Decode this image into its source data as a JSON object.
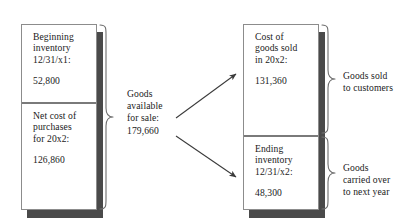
{
  "diagram": {
    "colors": {
      "shadow": "#4a4a4a",
      "box_border": "#8c8c8c",
      "divider": "#7a7a7a",
      "arrow": "#3a3a3a",
      "brace": "#6e6e6e",
      "text": "#1a1a1a",
      "background": "#ffffff"
    },
    "left_stack": {
      "beginning_inventory": {
        "line1": "Beginning",
        "line2": "inventory",
        "line3": "12/31/x1:",
        "amount": "52,800"
      },
      "net_cost_of_purchases": {
        "line1": "Net cost of",
        "line2": "purchases",
        "line3": "for 20x2:",
        "amount": "126,860"
      }
    },
    "center": {
      "line1": "Goods",
      "line2": "available",
      "line3": "for sale:",
      "amount": "179,660"
    },
    "right_stack": {
      "cost_of_goods_sold": {
        "line1": "Cost of",
        "line2": "goods sold",
        "line3": "in 20x2:",
        "amount": "131,360"
      },
      "ending_inventory": {
        "line1": "Ending",
        "line2": "inventory",
        "line3": "12/31/x2:",
        "amount": "48,300"
      }
    },
    "side_labels": {
      "goods_sold": {
        "line1": "Goods sold",
        "line2": "to customers"
      },
      "goods_carried": {
        "line1": "Goods",
        "line2": "carried over",
        "line3": "to next year"
      }
    }
  }
}
